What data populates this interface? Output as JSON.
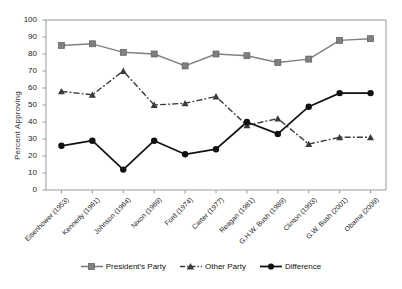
{
  "chart_data": {
    "type": "line",
    "title": "",
    "xlabel": "",
    "ylabel": "Percent Approving",
    "ylim": [
      0,
      100
    ],
    "ytick_values": [
      0,
      10,
      20,
      30,
      40,
      50,
      60,
      70,
      80,
      90,
      100
    ],
    "grid": false,
    "legend_position": "bottom",
    "categories": [
      "Eisenhower (1953)",
      "Kennedy (1961)",
      "Johnson (1964)",
      "Nixon (1969)",
      "Ford (1974)",
      "Carter (1977)",
      "Reagan (1981)",
      "G.H.W. Bush (1989)",
      "Clinton (1993)",
      "G.W. Bush (2001)",
      "Obama (2009)"
    ],
    "series": [
      {
        "name": "President's Party",
        "marker": "square",
        "linestyle": "solid",
        "color": "#808080",
        "values": [
          85,
          86,
          81,
          80,
          73,
          80,
          79,
          75,
          77,
          88,
          89
        ]
      },
      {
        "name": "Other Party",
        "marker": "triangle",
        "linestyle": "dash-dot",
        "color": "#3a3a3a",
        "values": [
          58,
          56,
          70,
          50,
          51,
          55,
          38,
          42,
          27,
          31,
          31
        ]
      },
      {
        "name": "Difference",
        "marker": "circle",
        "linestyle": "solid",
        "color": "#111111",
        "values": [
          26,
          29,
          12,
          29,
          21,
          24,
          40,
          33,
          49,
          57,
          57
        ]
      }
    ]
  },
  "legend": {
    "items": [
      {
        "label": "President's Party"
      },
      {
        "label": "Other Party"
      },
      {
        "label": "Difference"
      }
    ]
  },
  "colors": {
    "president_party": "#808080",
    "other_party": "#3a3a3a",
    "difference": "#111111",
    "frame": "#9a9a9a",
    "text": "#222222"
  }
}
